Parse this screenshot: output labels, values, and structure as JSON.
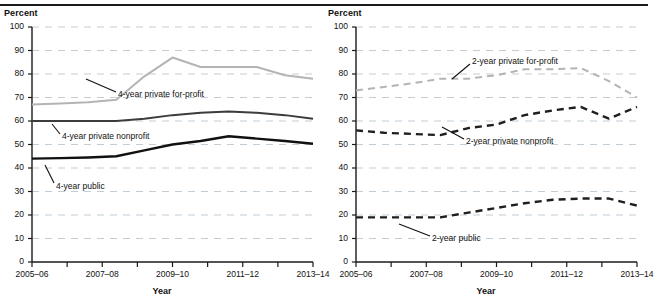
{
  "figure": {
    "top_rule": true,
    "panels": [
      {
        "id": "four-year",
        "ylabel": "Percent",
        "xlabel": "Year",
        "yticks": [
          0,
          10,
          20,
          30,
          40,
          50,
          60,
          70,
          80,
          90,
          100
        ],
        "xticks": [
          "2005–06",
          "",
          "2007–08",
          "",
          "2009–10",
          "",
          "2011–12",
          "",
          "2013–14"
        ],
        "series": [
          {
            "name": "4-year private for-profit",
            "label": "4-year private for-profit",
            "color": "#b4b4b4",
            "style": "solid",
            "width": 2.0,
            "values": [
              67,
              67.5,
              68,
              69,
              79,
              87,
              83,
              83,
              83,
              79.5,
              78
            ],
            "label_x": 118,
            "label_y": 95,
            "leader": [
              [
                86,
                79
              ],
              [
                116,
                92
              ]
            ]
          },
          {
            "name": "4-year private nonprofit",
            "label": "4-year private nonprofit",
            "color": "#3c3c3c",
            "style": "solid",
            "width": 2.0,
            "values": [
              60,
              60,
              60,
              60,
              61,
              62.5,
              63.5,
              64,
              63.5,
              62.5,
              61
            ],
            "label_x": 62,
            "label_y": 137,
            "leader": [
              [
                52,
                124
              ],
              [
                60,
                134
              ]
            ]
          },
          {
            "name": "4-year public",
            "label": "4-year public",
            "color": "#111111",
            "style": "solid",
            "width": 2.4,
            "values": [
              44,
              44.2,
              44.5,
              45,
              47.5,
              50,
              51.5,
              53.5,
              52.5,
              51.5,
              50.3
            ],
            "label_x": 56,
            "label_y": 187,
            "leader": [
              [
                45,
                165
              ],
              [
                54,
                183
              ]
            ]
          }
        ]
      },
      {
        "id": "two-year",
        "ylabel": "Percent",
        "xlabel": "Year",
        "yticks": [
          0,
          10,
          20,
          30,
          40,
          50,
          60,
          70,
          80,
          90,
          100
        ],
        "xticks": [
          "2005–06",
          "",
          "2007–08",
          "",
          "2009–10",
          "",
          "2011–12",
          "",
          "2013–14"
        ],
        "series": [
          {
            "name": "2-year private for-profit",
            "label": "2-year private for-profit",
            "color": "#b4b4b4",
            "style": "dashed",
            "width": 2.0,
            "values": [
              73,
              74.5,
              76,
              78,
              78,
              79.5,
              82,
              82,
              82.5,
              77,
              70
            ],
            "label_x": 148,
            "label_y": 62,
            "leader": [
              [
                128,
                79
              ],
              [
                146,
                64
              ]
            ]
          },
          {
            "name": "2-year private nonprofit",
            "label": "2-year private nonprofit",
            "color": "#1f1f1f",
            "style": "dashed",
            "width": 2.4,
            "values": [
              56,
              55,
              54.5,
              54,
              57,
              58.5,
              62.5,
              64.5,
              66,
              61,
              66
            ],
            "label_x": 142,
            "label_y": 142,
            "leader": [
              [
                118,
                127
              ],
              [
                140,
                139
              ]
            ]
          },
          {
            "name": "2-year public",
            "label": "2-year public",
            "color": "#1f1f1f",
            "style": "dashed",
            "width": 2.4,
            "values": [
              19,
              19,
              19,
              19,
              21,
              23,
              25,
              26.5,
              27,
              27,
              24
            ],
            "label_x": 108,
            "label_y": 239,
            "leader": [
              [
                75,
                224
              ],
              [
                106,
                236
              ]
            ]
          }
        ]
      }
    ]
  },
  "chart_data": {
    "type": "line",
    "title": "",
    "n_panels": 2,
    "shared": {
      "xlabel": "Year",
      "ylabel": "Percent",
      "ylim": [
        0,
        100
      ],
      "ytick_step": 10,
      "grid": "horizontal-dashed",
      "legend": "inline-annotations",
      "x": [
        "2005–06",
        "2006–07",
        "2007–08",
        "2008–09",
        "2009–10",
        "2010–11",
        "2011–12",
        "2012–13",
        "2013–14"
      ],
      "xtick_labels_shown": [
        "2005–06",
        "2007–08",
        "2009–10",
        "2011–12",
        "2013–14"
      ]
    },
    "panels": [
      {
        "panel": "4-year institutions",
        "series": [
          {
            "name": "4-year private for-profit",
            "values": [
              67,
              68,
              69,
              79,
              87,
              83,
              83,
              79.5,
              78
            ]
          },
          {
            "name": "4-year private nonprofit",
            "values": [
              60,
              60,
              60,
              61,
              62.5,
              63.5,
              63.5,
              62.5,
              61
            ]
          },
          {
            "name": "4-year public",
            "values": [
              44,
              44.5,
              45,
              47.5,
              50,
              51.5,
              53.5,
              51.5,
              50.3
            ]
          }
        ]
      },
      {
        "panel": "2-year institutions",
        "series": [
          {
            "name": "2-year private for-profit",
            "values": [
              73,
              76,
              78,
              78,
              79.5,
              82,
              82.5,
              77,
              70
            ]
          },
          {
            "name": "2-year private nonprofit",
            "values": [
              56,
              54.5,
              54,
              57,
              58.5,
              62.5,
              66,
              61,
              66
            ]
          },
          {
            "name": "2-year public",
            "values": [
              19,
              19,
              19,
              21,
              23,
              25,
              27,
              27,
              24
            ]
          }
        ]
      }
    ]
  }
}
